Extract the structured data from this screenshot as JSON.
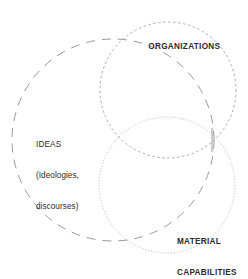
{
  "diagram": {
    "type": "venn",
    "background_color": "#ffffff",
    "stroke_color": "#9a9a9a",
    "text_color": "#2b2b2b",
    "circles": [
      {
        "name": "ideas",
        "label_lines": [
          "IDEAS",
          "(Ideologies,",
          "discourses)"
        ],
        "stroke_style": "long-dash",
        "cx": 113,
        "cy": 140,
        "r": 101
      },
      {
        "name": "organizations",
        "label_lines": [
          "ORGANIZATIONS"
        ],
        "stroke_style": "short-dash",
        "cx": 168,
        "cy": 90,
        "r": 68
      },
      {
        "name": "material-capabilities",
        "label_lines": [
          "MATERIAL",
          "CAPABILITIES"
        ],
        "stroke_style": "dotted",
        "cx": 167,
        "cy": 185,
        "r": 68
      }
    ],
    "leader_line": {
      "name": "intersection-leader-line",
      "x": 212,
      "y1": 128,
      "y2": 152
    }
  },
  "labels": {
    "organizations": "ORGANIZATIONS",
    "ideas_main": "IDEAS",
    "ideas_sub_1": "(Ideologies,",
    "ideas_sub_2": "discourses)",
    "material_line_1": "MATERIAL",
    "material_line_2": "CAPABILITIES"
  }
}
